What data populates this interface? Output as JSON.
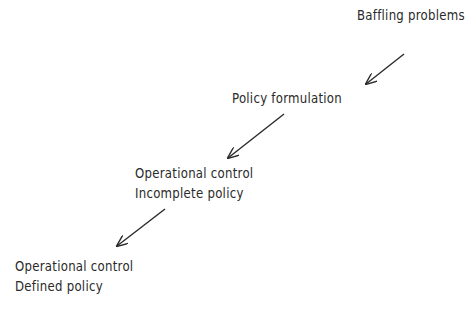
{
  "diagram": {
    "type": "flow",
    "direction": "top-right to bottom-left",
    "nodes": [
      {
        "id": "baffling",
        "lines": [
          "Baffling problems"
        ]
      },
      {
        "id": "formulation",
        "lines": [
          "Policy formulation"
        ]
      },
      {
        "id": "incomplete",
        "lines": [
          "Operational control",
          "Incomplete policy"
        ]
      },
      {
        "id": "defined",
        "lines": [
          "Operational control",
          "Defined policy"
        ]
      }
    ],
    "edges": [
      {
        "from": "baffling",
        "to": "formulation"
      },
      {
        "from": "formulation",
        "to": "incomplete"
      },
      {
        "from": "incomplete",
        "to": "defined"
      }
    ],
    "colors": {
      "ink": "#2a2a2a",
      "background": "#ffffff"
    }
  }
}
